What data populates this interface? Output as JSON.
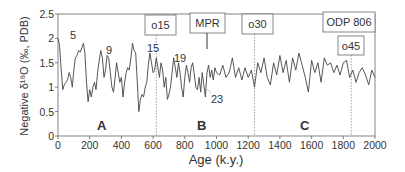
{
  "chart_data": {
    "type": "line",
    "title": "",
    "xlabel": "Age (k.y.)",
    "ylabel": "Negative δ18O (‰, PDB)",
    "xlim": [
      0,
      2000
    ],
    "ylim": [
      0,
      2.5
    ],
    "x_ticks": [
      "0",
      "200",
      "400",
      "600",
      "800",
      "1000",
      "1200",
      "1400",
      "1600",
      "1800",
      "2000"
    ],
    "y_ticks": [
      "0",
      "0.5",
      "1",
      "1.5",
      "2",
      "2.5"
    ],
    "grid": false,
    "series": [
      {
        "name": "ODP 806",
        "x": [
          0,
          10,
          20,
          30,
          40,
          50,
          60,
          70,
          80,
          90,
          100,
          110,
          120,
          130,
          140,
          150,
          160,
          170,
          180,
          190,
          200,
          210,
          220,
          230,
          240,
          250,
          260,
          270,
          280,
          290,
          300,
          310,
          320,
          330,
          340,
          350,
          360,
          370,
          380,
          390,
          400,
          410,
          420,
          430,
          440,
          450,
          460,
          470,
          480,
          490,
          500,
          510,
          520,
          530,
          540,
          550,
          560,
          570,
          580,
          590,
          600,
          610,
          620,
          630,
          640,
          650,
          660,
          670,
          680,
          690,
          700,
          710,
          720,
          730,
          740,
          750,
          760,
          770,
          780,
          790,
          800,
          810,
          820,
          830,
          840,
          850,
          860,
          870,
          880,
          890,
          900,
          910,
          920,
          930,
          940,
          950,
          960,
          970,
          980,
          990,
          1000,
          1020,
          1040,
          1060,
          1080,
          1100,
          1120,
          1140,
          1160,
          1180,
          1200,
          1220,
          1240,
          1260,
          1280,
          1300,
          1320,
          1340,
          1360,
          1380,
          1400,
          1420,
          1440,
          1460,
          1480,
          1500,
          1520,
          1540,
          1560,
          1580,
          1600,
          1620,
          1640,
          1660,
          1680,
          1700,
          1720,
          1740,
          1760,
          1780,
          1800,
          1820,
          1840,
          1860,
          1880,
          1900,
          1920,
          1940,
          1960,
          1980,
          2000
        ],
        "values": [
          2.0,
          1.85,
          1.35,
          0.95,
          1.05,
          1.1,
          1.15,
          1.3,
          1.2,
          1.0,
          1.35,
          1.6,
          1.65,
          1.75,
          1.72,
          1.8,
          1.9,
          1.7,
          1.1,
          0.7,
          0.95,
          0.8,
          1.0,
          1.1,
          0.95,
          1.3,
          1.55,
          1.75,
          1.6,
          1.2,
          1.35,
          1.65,
          1.6,
          1.3,
          1.0,
          0.9,
          1.2,
          1.5,
          1.3,
          1.1,
          1.2,
          0.8,
          1.1,
          1.3,
          1.4,
          1.35,
          1.6,
          1.9,
          1.75,
          1.7,
          1.1,
          0.5,
          0.75,
          0.85,
          0.8,
          1.0,
          1.1,
          1.45,
          1.7,
          1.5,
          1.3,
          1.35,
          1.6,
          1.4,
          1.2,
          1.5,
          1.35,
          1.0,
          1.2,
          0.75,
          0.85,
          1.0,
          1.3,
          1.6,
          1.4,
          1.2,
          1.5,
          1.3,
          1.0,
          0.8,
          1.2,
          1.45,
          1.3,
          1.1,
          1.4,
          1.5,
          1.25,
          1.0,
          0.95,
          1.2,
          0.9,
          1.3,
          1.05,
          0.8,
          1.3,
          1.45,
          1.2,
          1.35,
          1.15,
          1.4,
          1.3,
          1.25,
          1.45,
          1.2,
          1.3,
          1.6,
          1.2,
          1.4,
          1.15,
          1.4,
          1.2,
          1.35,
          1.0,
          1.5,
          1.3,
          1.6,
          1.2,
          1.05,
          1.5,
          1.25,
          1.65,
          1.3,
          1.55,
          1.1,
          1.6,
          1.35,
          1.7,
          1.45,
          1.2,
          0.9,
          1.55,
          1.3,
          1.5,
          1.1,
          1.6,
          1.45,
          1.5,
          1.3,
          1.45,
          1.25,
          1.5,
          1.55,
          1.2,
          1.35,
          1.1,
          1.3,
          1.4,
          1.25,
          1.05,
          1.35,
          1.2
        ]
      }
    ],
    "annotations": [
      {
        "text": "5",
        "x": 80,
        "y": 2.0
      },
      {
        "text": "9",
        "x": 320,
        "y": 1.6
      },
      {
        "text": "15",
        "x": 570,
        "y": 1.55
      },
      {
        "text": "19",
        "x": 790,
        "y": 1.4
      },
      {
        "text": "23",
        "x": 960,
        "y": 0.85
      },
      {
        "text": "A",
        "x": 260,
        "y": 0.2
      },
      {
        "text": "B",
        "x": 900,
        "y": 0.2
      },
      {
        "text": "C",
        "x": 1530,
        "y": 0.2
      }
    ],
    "boxed_labels": [
      {
        "text": "o15",
        "x": 620
      },
      {
        "text": "MPR",
        "x": 930
      },
      {
        "text": "o30",
        "x": 1240
      },
      {
        "text": "ODP 806",
        "x": 1760
      },
      {
        "text": "o45",
        "x": 1850
      }
    ],
    "vertical_dotted_lines_at_x": [
      620,
      1240,
      1850
    ]
  },
  "labels": {
    "xlabel": "Age (k.y.)",
    "ylabel": "Negative δ¹⁸O (‰, PDB)",
    "box_o15": "o15",
    "box_mpr": "MPR",
    "box_o30": "o30",
    "box_odp": "ODP 806",
    "box_o45": "o45",
    "stage_5": "5",
    "stage_9": "9",
    "stage_15": "15",
    "stage_19": "19",
    "stage_23": "23",
    "region_a": "A",
    "region_b": "B",
    "region_c": "C"
  }
}
